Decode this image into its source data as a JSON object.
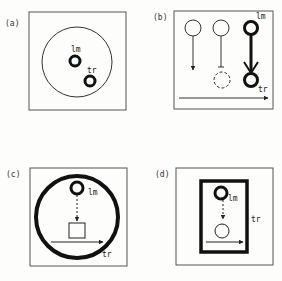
{
  "figure": {
    "panels": [
      {
        "id": "a",
        "label": "(a)",
        "landmark_label": "lm",
        "trajector_label": "tr"
      },
      {
        "id": "b",
        "label": "(b)",
        "landmark_label": "lm",
        "trajector_label": "tr"
      },
      {
        "id": "c",
        "label": "(c)",
        "landmark_label": "lm",
        "trajector_label": "tr"
      },
      {
        "id": "d",
        "label": "(d)",
        "landmark_label": "lm",
        "trajector_label": "tr"
      }
    ],
    "colors": {
      "ink": "#1a1a1a",
      "frame": "#555555",
      "background": "#fdfdfb"
    }
  }
}
